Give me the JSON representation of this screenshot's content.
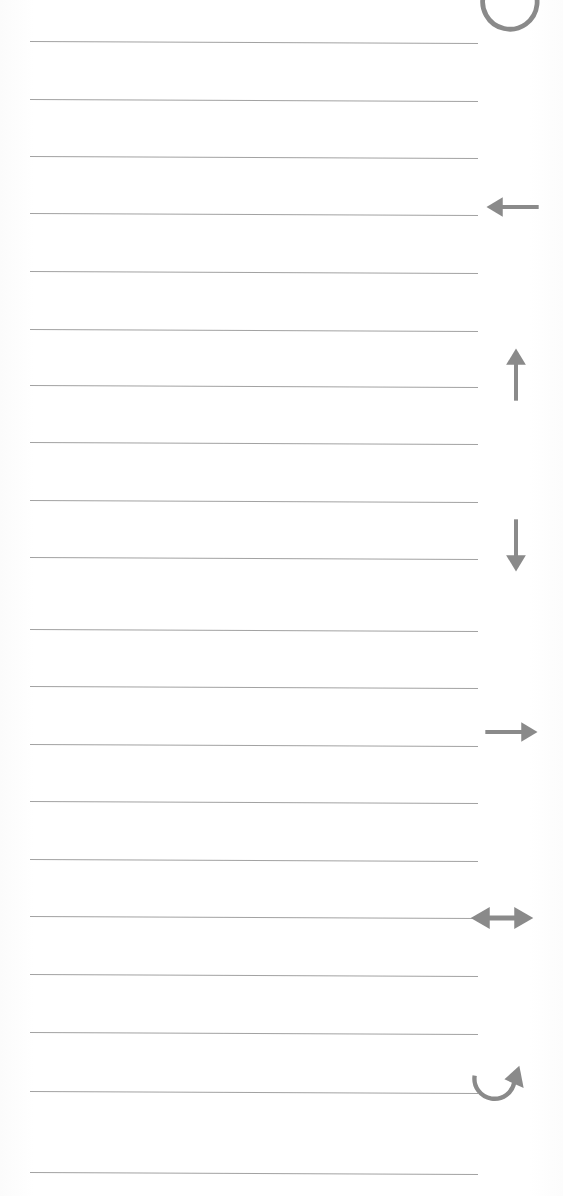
{
  "page": {
    "kind": "ruled-notebook-paper-scan",
    "width": 563,
    "height": 1196,
    "background_color": "#ffffff",
    "paper_tint": "#fdfdfd"
  },
  "rules": {
    "label": "horizontal ruled lines",
    "count": 20,
    "color": "#9a9a9a",
    "thickness_px": 1,
    "left_x": 30,
    "right_x": 478,
    "spacing_px": 57.5,
    "tilt_deg": 0.25,
    "y_positions": [
      41,
      99,
      156,
      213,
      271,
      329,
      385,
      442,
      500,
      557,
      629,
      686,
      744,
      801,
      859,
      916,
      974,
      1032,
      1091,
      1172
    ]
  },
  "annotations": {
    "label": "arrow annotations in right margin",
    "color": "#8a8a8a",
    "stroke_width": 7,
    "items": [
      {
        "icon": "refresh-circular-arrow-icon",
        "name": "circular-refresh-arrow",
        "description": "counter-clockwise circular arrow, cropped at top edge",
        "x": 477,
        "y": -34,
        "size": 68,
        "clipped": true
      },
      {
        "icon": "arrow-left-icon",
        "name": "left-arrow",
        "description": "arrow pointing left",
        "x": 483,
        "y": 178,
        "size": 58,
        "clipped": false
      },
      {
        "icon": "arrow-up-icon",
        "name": "up-arrow",
        "description": "arrow pointing up",
        "x": 487,
        "y": 345,
        "size": 58,
        "clipped": false
      },
      {
        "icon": "arrow-down-icon",
        "name": "down-arrow",
        "description": "arrow pointing down",
        "x": 487,
        "y": 517,
        "size": 58,
        "clipped": false
      },
      {
        "icon": "arrow-right-icon",
        "name": "right-arrow",
        "description": "arrow pointing right",
        "x": 483,
        "y": 703,
        "size": 58,
        "clipped": false
      },
      {
        "icon": "arrow-left-right-icon",
        "name": "left-right-double-arrow",
        "description": "double headed horizontal arrow",
        "x": 468,
        "y": 884,
        "size": 68,
        "clipped": false
      },
      {
        "icon": "curved-return-arrow-icon",
        "name": "curved-u-turn-arrow",
        "description": "curved arrow sweeping left then up to the right",
        "x": 466,
        "y": 1057,
        "size": 62,
        "clipped": false
      }
    ]
  }
}
